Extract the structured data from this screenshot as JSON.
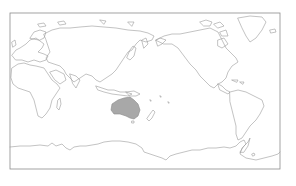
{
  "map": {
    "projection": "equirectangular",
    "central_longitude": "150E",
    "frame": {
      "x": 10,
      "y": 13,
      "width": 270,
      "height": 156
    },
    "colors": {
      "background": "#ffffff",
      "coastline": "#9a9a9a",
      "frame": "#8c8c8c",
      "highlight_fill": "#a8a8a8"
    },
    "highlighted_region": "Australia",
    "regions": [
      "Europe",
      "Africa",
      "Asia",
      "Australia",
      "Antarctica",
      "North America",
      "South America",
      "Greenland",
      "New Zealand"
    ]
  }
}
